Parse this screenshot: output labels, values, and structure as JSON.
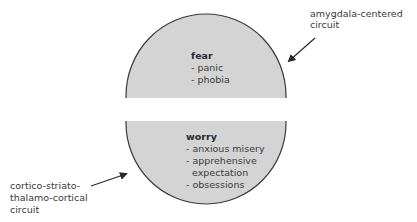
{
  "colors": {
    "fill": "#d4d4d4",
    "stroke": "#3a3a3a",
    "text": "#3a3a3a"
  },
  "top_half": {
    "title": "fear",
    "items": [
      "- panic",
      "- phobia"
    ]
  },
  "bottom_half": {
    "title": "worry",
    "items": [
      "- anxious misery",
      "- apprehensive",
      "  expectation",
      "- obsessions"
    ]
  },
  "annotations": {
    "top_right": {
      "lines": [
        "amygdala-centered",
        "circuit"
      ]
    },
    "bottom_left": {
      "lines": [
        "cortico-striato-",
        "thalamo-cortical",
        "circuit"
      ]
    }
  }
}
